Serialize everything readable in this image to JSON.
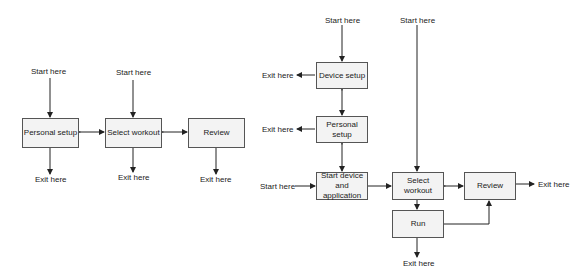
{
  "left_diagram": {
    "nodes": {
      "personal_setup": "Personal setup",
      "select_workout": "Select workout",
      "review": "Review"
    },
    "labels": {
      "start1": "Start here",
      "start2": "Start here",
      "exit1": "Exit here",
      "exit2": "Exit here",
      "exit3": "Exit here"
    }
  },
  "right_diagram": {
    "nodes": {
      "device_setup": "Device setup",
      "personal_setup": "Personal setup",
      "start_device": "Start device and application",
      "select_workout": "Select workout",
      "review": "Review",
      "run": "Run"
    },
    "labels": {
      "start_top": "Start here",
      "start_top2": "Start here",
      "start_left": "Start here",
      "exit_device": "Exit here",
      "exit_personal": "Exit here",
      "exit_review": "Exit here",
      "exit_run": "Exit here"
    }
  }
}
